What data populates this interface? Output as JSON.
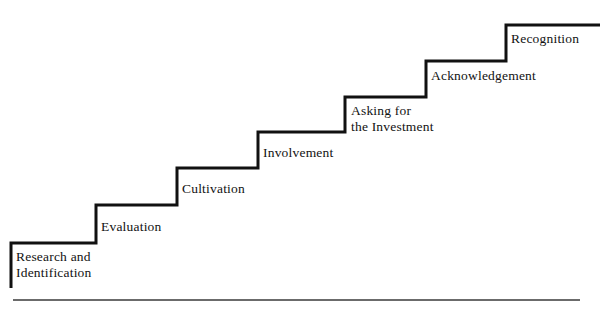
{
  "diagram": {
    "type": "staircase-process-diagram",
    "orientation": "ascending-left-to-right",
    "step_count": 7,
    "colors": {
      "line": "#111111",
      "text": "#121212",
      "background": "#ffffff",
      "baseline_rule": "#3a3a3a"
    },
    "steps": [
      {
        "id": "research-and-identification",
        "order": 1,
        "label": "Research and\nIdentification",
        "lines": [
          "Research and",
          "Identification"
        ],
        "label_x": 16,
        "label_y": 249
      },
      {
        "id": "evaluation",
        "order": 2,
        "label": "Evaluation",
        "lines": [
          "Evaluation"
        ],
        "label_x": 101,
        "label_y": 219
      },
      {
        "id": "cultivation",
        "order": 3,
        "label": "Cultivation",
        "lines": [
          "Cultivation"
        ],
        "label_x": 182,
        "label_y": 181
      },
      {
        "id": "involvement",
        "order": 4,
        "label": "Involvement",
        "lines": [
          "Involvement"
        ],
        "label_x": 263,
        "label_y": 145
      },
      {
        "id": "asking-for-the-investment",
        "order": 5,
        "label": "Asking for\nthe Investment",
        "lines": [
          "Asking for",
          "the Investment"
        ],
        "label_x": 351,
        "label_y": 103
      },
      {
        "id": "acknowledgement",
        "order": 6,
        "label": "Acknowledgement",
        "lines": [
          "Acknowledgement"
        ],
        "label_x": 431,
        "label_y": 68
      },
      {
        "id": "recognition",
        "order": 7,
        "label": "Recognition",
        "lines": [
          "Recognition"
        ],
        "label_x": 511,
        "label_y": 31
      }
    ],
    "geometry": {
      "stair_path": "M 11 288 L 11 243 L 96 243 L 96 205 L 177 205 L 177 168 L 258 168 L 258 132 L 345 132 L 345 97 L 426 97 L 426 61 L 506 61 L 506 25 L 600 25",
      "stroke_width": 3,
      "baseline": {
        "x1": 13,
        "y1": 300,
        "x2": 580,
        "y2": 300,
        "stroke_width": 1.4
      }
    }
  }
}
